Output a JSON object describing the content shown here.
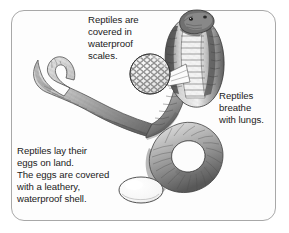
{
  "figure": {
    "background_color": "#ffffff",
    "panel_color": "#fdfdfd",
    "border_color": "#a8a8a8",
    "ink_color": "#1b1b1b"
  },
  "captions": {
    "scales": "Reptiles are\ncovered in\nwaterproof\nscales.",
    "lungs": "Reptiles\nbreathe\nwith lungs.",
    "eggs": "Reptiles lay their\neggs on land.\nThe eggs are covered\nwith a leathery,\nwaterproof shell."
  },
  "illustration": {
    "snake_label": "cobra-illustration",
    "scale_magnifier_label": "magnified-scales-circle",
    "egg_label": "reptile-egg",
    "egg_fill": "#fbfbfb",
    "snake_tone_light": "#e3e3e3",
    "snake_tone_mid": "#9a9a9a",
    "snake_tone_dark": "#4a4a4a"
  }
}
